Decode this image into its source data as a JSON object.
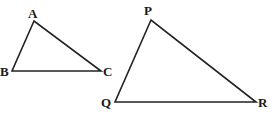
{
  "diagram": {
    "type": "similar-triangles",
    "colors": {
      "stroke": "#222222",
      "label": "#1a1a1a",
      "background": "#ffffff"
    },
    "triangles": [
      {
        "name": "ABC",
        "vertices": [
          {
            "label": "A",
            "x": 34,
            "y": 21,
            "lx": 28,
            "ly": 18
          },
          {
            "label": "B",
            "x": 12,
            "y": 71,
            "lx": 0,
            "ly": 76
          },
          {
            "label": "C",
            "x": 101,
            "y": 71,
            "lx": 103,
            "ly": 76
          }
        ]
      },
      {
        "name": "PQR",
        "vertices": [
          {
            "label": "P",
            "x": 151,
            "y": 20,
            "lx": 144,
            "ly": 15
          },
          {
            "label": "Q",
            "x": 115,
            "y": 102,
            "lx": 101,
            "ly": 107
          },
          {
            "label": "R",
            "x": 256,
            "y": 102,
            "lx": 258,
            "ly": 107
          }
        ]
      }
    ]
  }
}
